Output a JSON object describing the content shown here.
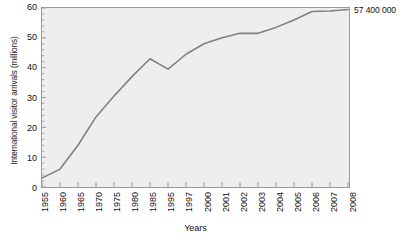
{
  "chart_data": {
    "type": "line",
    "title": "",
    "xlabel": "Years",
    "ylabel": "International visitor arrivals (millions)",
    "categories": [
      "1955",
      "1960",
      "1965",
      "1970",
      "1975",
      "1980",
      "1985",
      "1995",
      "1997",
      "2000",
      "2001",
      "2002",
      "2003",
      "2004",
      "2005",
      "2006",
      "2007",
      "2008"
    ],
    "values": [
      3,
      6,
      14,
      23.5,
      30.5,
      37,
      43,
      39.5,
      44.5,
      48,
      50,
      51.5,
      51.5,
      53.5,
      56,
      58.8,
      59,
      59.5
    ],
    "ylim": [
      0,
      60
    ],
    "yticks": [
      0,
      10,
      20,
      30,
      40,
      50,
      60
    ],
    "grid": false,
    "legend": "none",
    "line_color": "#808080",
    "plot_bg_color": "#eeeeee",
    "axis_color": "#9a9a9a",
    "annotations": [
      {
        "text": "57 400 000",
        "at_category": "2008"
      }
    ]
  },
  "figure": {
    "annotation_label": "57 400 000",
    "caption_partial": ""
  }
}
